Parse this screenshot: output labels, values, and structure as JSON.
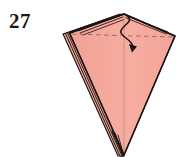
{
  "figure": {
    "step_number": "27",
    "background_color": "#ffffff"
  },
  "colors": {
    "paper_fill": "#f4a99c",
    "paper_fill_shade": "#efa092",
    "paper_fill_highlight": "#f7b4a7",
    "outline": "#1b1412",
    "layer_edge": "#2a1f1c",
    "crease_dashed": "#8a6a66",
    "center_crease": "#c98d84",
    "arrow": "#17100e",
    "step_text": "#1a1a1a"
  },
  "shape": {
    "name": "kite-dart",
    "apex": {
      "x": 124,
      "y": 14
    },
    "left_corner": {
      "x": 69,
      "y": 33
    },
    "right_corner": {
      "x": 175,
      "y": 36
    },
    "bottom_tip": {
      "x": 124,
      "y": 155
    },
    "outline_points": "124,14 69,33 124,155 175,36",
    "layer_count": 4
  },
  "creases": {
    "horizontal_fold": {
      "label": "valley-fold-line",
      "style": "dashed",
      "from": {
        "x": 71,
        "y": 34
      },
      "to": {
        "x": 174,
        "y": 37
      }
    },
    "center_crease": {
      "label": "center-crease",
      "style": "solid-faint",
      "from": {
        "x": 124,
        "y": 16
      },
      "to": {
        "x": 124,
        "y": 154
      }
    }
  },
  "arrow": {
    "name": "fold-direction-arrow",
    "style": "s-curve",
    "head": "solid-triangle",
    "start": {
      "x": 127,
      "y": 16
    },
    "end": {
      "x": 133,
      "y": 49
    }
  },
  "layer_edges": {
    "top_left_count": 4,
    "left_count": 4,
    "bottom_count": 4,
    "top_right_count": 2
  }
}
